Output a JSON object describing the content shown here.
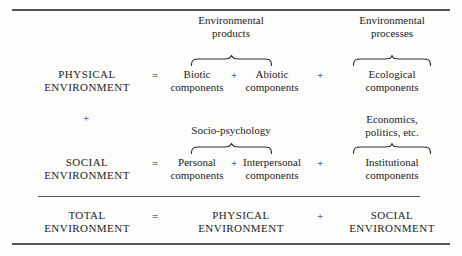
{
  "figure": {
    "type": "equation-table",
    "rules": [
      "top-rule",
      "middle-rule",
      "bottom-rule"
    ],
    "colors": {
      "ink": "#1c1c1c",
      "rule": "#555555",
      "paper": "#fdfdfc"
    }
  },
  "headers": {
    "products": {
      "line1": "Environmental",
      "line2": "products"
    },
    "processes": {
      "line1": "Environmental",
      "line2": "processes"
    }
  },
  "rows": {
    "physical": {
      "label_line1": "PHYSICAL",
      "label_line2": "ENVIRONMENT",
      "equals": "=",
      "term1_line1": "Biotic",
      "term1_line2": "components",
      "plus1": "+",
      "term2_line1": "Abiotic",
      "term2_line2": "components",
      "plus2": "+",
      "term3_line1": "Ecological",
      "term3_line2": "components"
    },
    "connector": {
      "plus": "+",
      "middle_label": "Socio-psychology",
      "right_line1": "Economics,",
      "right_line2": "politics, etc."
    },
    "social": {
      "label_line1": "SOCIAL",
      "label_line2": "ENVIRONMENT",
      "equals": "=",
      "term1_line1": "Personal",
      "term1_line2": "components",
      "plus1": "+",
      "term2_line1": "Interpersonal",
      "term2_line2": "components",
      "plus2": "+",
      "term3_line1": "Institutional",
      "term3_line2": "components"
    },
    "total": {
      "label_line1": "TOTAL",
      "label_line2": "ENVIRONMENT",
      "equals": "=",
      "term1_line1": "PHYSICAL",
      "term1_line2": "ENVIRONMENT",
      "plus1": "+",
      "term2_line1": "SOCIAL",
      "term2_line2": "ENVIRONMENT"
    }
  },
  "braces": {
    "products_upper": "upward-curly-brace",
    "processes_upper": "upward-curly-brace",
    "socio_upper": "upward-curly-brace",
    "institutional_upper": "upward-curly-brace"
  }
}
